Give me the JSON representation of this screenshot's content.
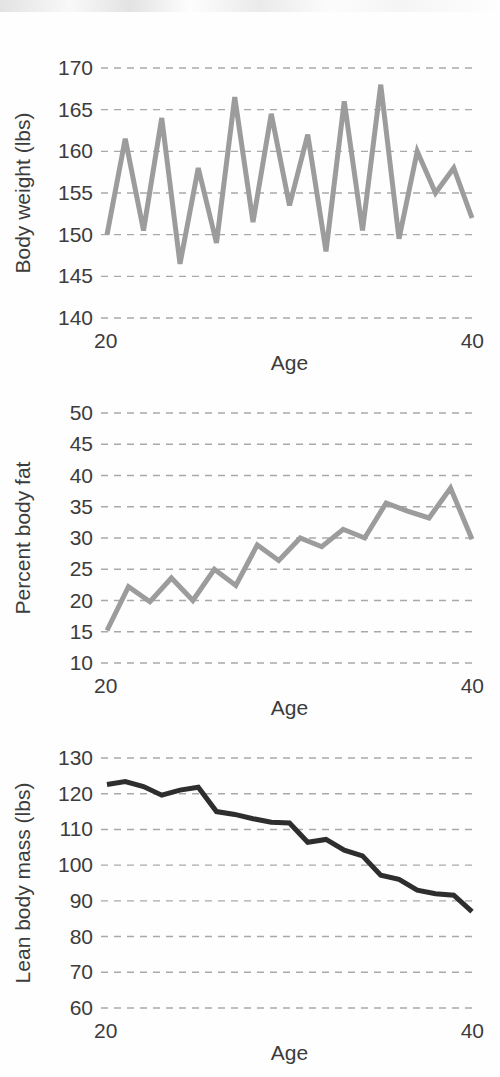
{
  "figure": {
    "background_color": "#fefefe",
    "panel_count": 3
  },
  "chart_data": [
    {
      "type": "line",
      "panel_index": 1,
      "title": "",
      "xlabel": "Age",
      "ylabel": "Body weight (lbs)",
      "xlim": [
        20,
        40
      ],
      "ylim": [
        140,
        170
      ],
      "xticks": [
        20,
        40
      ],
      "xticklabels": [
        "20",
        "40"
      ],
      "yticks": [
        140,
        145,
        150,
        155,
        160,
        165,
        170
      ],
      "yticklabels": [
        "140",
        "145",
        "150",
        "155",
        "160",
        "165",
        "170"
      ],
      "grid": true,
      "grid_color": "#a9a9a9",
      "line_color": "#9c9c9c",
      "line_width": 5,
      "x": [
        20,
        21,
        22,
        23,
        24,
        25,
        26,
        27,
        28,
        29,
        30,
        31,
        32,
        33,
        34,
        35,
        36,
        37,
        38,
        39,
        40
      ],
      "values": [
        150.0,
        161.5,
        150.5,
        164.0,
        146.5,
        158.0,
        149.0,
        166.5,
        151.5,
        164.5,
        153.5,
        162.0,
        148.0,
        166.0,
        150.5,
        168.0,
        149.5,
        160.0,
        155.0,
        158.0,
        152.0
      ],
      "series": [
        {
          "name": "Body weight",
          "values": [
            150.0,
            161.5,
            150.5,
            164.0,
            146.5,
            158.0,
            149.0,
            166.5,
            151.5,
            164.5,
            153.5,
            162.0,
            148.0,
            166.0,
            150.5,
            168.0,
            149.5,
            160.0,
            155.0,
            158.0,
            152.0
          ]
        }
      ]
    },
    {
      "type": "line",
      "panel_index": 2,
      "title": "",
      "xlabel": "Age",
      "ylabel": "Percent body fat",
      "xlim": [
        20,
        40
      ],
      "ylim": [
        10,
        50
      ],
      "xticks": [
        20,
        40
      ],
      "xticklabels": [
        "20",
        "40"
      ],
      "yticks": [
        10,
        15,
        20,
        25,
        30,
        35,
        40,
        45,
        50
      ],
      "yticklabels": [
        "10",
        "15",
        "20",
        "25",
        "30",
        "35",
        "40",
        "45",
        "50"
      ],
      "grid": true,
      "grid_color": "#a9a9a9",
      "line_color": "#9c9c9c",
      "line_width": 5,
      "x": [
        20,
        21,
        22,
        23,
        24,
        25,
        26,
        27,
        28,
        29,
        30,
        31,
        32,
        33,
        34,
        35,
        36,
        37,
        38,
        39,
        40
      ],
      "values": [
        15.2,
        22.2,
        19.8,
        23.6,
        20.0,
        25.0,
        22.4,
        28.9,
        26.4,
        30.0,
        28.6,
        31.4,
        30.0,
        35.6,
        34.3,
        33.2,
        38.0,
        29.8,
        29.8,
        29.8,
        29.8
      ],
      "series": [
        {
          "name": "Percent body fat",
          "values": [
            15.2,
            22.2,
            19.8,
            23.6,
            20.0,
            25.0,
            22.4,
            28.9,
            26.4,
            30.0,
            28.6,
            31.4,
            30.0,
            35.6,
            34.3,
            33.2,
            38.0,
            29.8
          ]
        }
      ],
      "n_points": 18
    },
    {
      "type": "line",
      "panel_index": 3,
      "title": "",
      "xlabel": "Age",
      "ylabel": "Lean body mass (lbs)",
      "xlim": [
        20,
        40
      ],
      "ylim": [
        60,
        130
      ],
      "xticks": [
        20,
        40
      ],
      "xticklabels": [
        "20",
        "40"
      ],
      "yticks": [
        60,
        70,
        80,
        90,
        100,
        110,
        120,
        130
      ],
      "yticklabels": [
        "60",
        "70",
        "80",
        "90",
        "100",
        "110",
        "120",
        "130"
      ],
      "grid": true,
      "grid_color": "#a9a9a9",
      "line_color": "#2e2e2e",
      "line_width": 5,
      "x": [
        20,
        21,
        22,
        23,
        24,
        25,
        26,
        27,
        28,
        29,
        30,
        31,
        32,
        33,
        34,
        35,
        36,
        37,
        38,
        39,
        40
      ],
      "values": [
        122.6,
        123.4,
        122.0,
        119.6,
        121.0,
        121.8,
        115.0,
        114.2,
        113.0,
        112.0,
        111.8,
        106.4,
        107.2,
        104.2,
        102.6,
        97.2,
        96.0,
        93.0,
        92.0,
        91.6,
        87.0
      ],
      "series": [
        {
          "name": "Lean body mass",
          "values": [
            122.6,
            123.4,
            122.0,
            119.6,
            121.0,
            121.8,
            115.0,
            114.2,
            113.0,
            112.0,
            111.8,
            106.4,
            107.2,
            104.2,
            102.6,
            97.2,
            96.0,
            93.0,
            92.0,
            91.6,
            87.0
          ]
        }
      ]
    }
  ]
}
